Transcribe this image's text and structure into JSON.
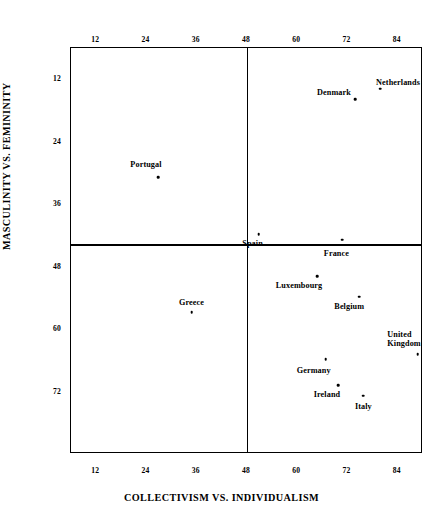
{
  "chart_data": {
    "type": "scatter",
    "title": "",
    "xlabel": "COLLECTIVISM VS. INDIVIDUALISM",
    "ylabel": "MASCULINITY VS. FEMININITY",
    "xlim": [
      6,
      90
    ],
    "ylim": [
      6,
      84
    ],
    "y_axis_inverted": true,
    "grid": false,
    "legend": "none",
    "xticks": [
      12,
      24,
      36,
      48,
      60,
      72,
      84
    ],
    "yticks": [
      12,
      24,
      36,
      48,
      60,
      72
    ],
    "xtick_labels": [
      "12",
      "24",
      "36",
      "48",
      "60",
      "72",
      "84"
    ],
    "ytick_labels": [
      "12",
      "24",
      "36",
      "48",
      "60",
      "72"
    ],
    "x_axis_top": true,
    "x_axis_bottom": true,
    "quadrant_lines": {
      "x": 47,
      "y": 41
    },
    "points": [
      {
        "label": "Netherlands",
        "x": 80,
        "y": 14,
        "label_pos": "left",
        "label_dx": -4,
        "label_dy": -6
      },
      {
        "label": "Denmark",
        "x": 74,
        "y": 16,
        "label_pos": "right",
        "label_dx": -4,
        "label_dy": -6
      },
      {
        "label": "Portugal",
        "x": 27,
        "y": 31,
        "label_pos": "mid",
        "label_dx": -12,
        "label_dy": -12
      },
      {
        "label": "Spain",
        "x": 51,
        "y": 42,
        "label_pos": "mid",
        "label_dx": -6,
        "label_dy": 10
      },
      {
        "label": "France",
        "x": 71,
        "y": 43,
        "label_pos": "mid",
        "label_dx": -6,
        "label_dy": 14
      },
      {
        "label": "Luxembourg",
        "x": 65,
        "y": 50,
        "label_pos": "right",
        "label_dx": 5,
        "label_dy": 10
      },
      {
        "label": "Belgium",
        "x": 75,
        "y": 54,
        "label_pos": "right",
        "label_dx": 5,
        "label_dy": 10
      },
      {
        "label": "Greece",
        "x": 35,
        "y": 57,
        "label_pos": "mid",
        "label_dx": 0,
        "label_dy": -9
      },
      {
        "label": "United Kingdom",
        "label_line1": "United",
        "label_line2": "Kingdom",
        "x": 89,
        "y": 65,
        "label_pos": "right",
        "label_dx": 3,
        "label_dy": -15
      },
      {
        "label": "Germany",
        "x": 67,
        "y": 66,
        "label_pos": "right",
        "label_dx": 5,
        "label_dy": 12
      },
      {
        "label": "Ireland",
        "x": 70,
        "y": 71,
        "label_pos": "right",
        "label_dx": 2,
        "label_dy": 10
      },
      {
        "label": "Italy",
        "x": 76,
        "y": 73,
        "label_pos": "mid",
        "label_dx": 0,
        "label_dy": 11
      }
    ]
  }
}
